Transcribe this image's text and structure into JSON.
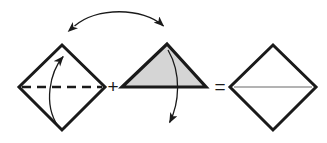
{
  "diagram": {
    "background_color": "#ffffff",
    "stroke_color": "#1a1a1a",
    "triangle_fill_color": "#d5d5d5",
    "result_line_color": "#9a9a9a",
    "operators": {
      "plus": "+",
      "equals": "="
    },
    "shapes": [
      {
        "id": "left-diamond",
        "name": "diamond-with-fold-line",
        "kind": "square-rotated-45",
        "fill": "none",
        "stroke": "#1a1a1a",
        "stroke_width": 3,
        "vertices": [
          {
            "x": 62,
            "y": 45
          },
          {
            "x": 105,
            "y": 87
          },
          {
            "x": 62,
            "y": 130
          },
          {
            "x": 19,
            "y": 87
          }
        ],
        "fold_line": {
          "name": "dashed-fold-line",
          "style": "dashed",
          "from": {
            "x": 22,
            "y": 87
          },
          "to": {
            "x": 102,
            "y": 87
          },
          "stroke_width": 2.4,
          "dash": "9 6"
        }
      },
      {
        "id": "middle-triangle",
        "name": "shaded-triangle",
        "kind": "triangle",
        "fill": "#d5d5d5",
        "stroke": "#1a1a1a",
        "stroke_width": 3.2,
        "vertices": [
          {
            "x": 167,
            "y": 44
          },
          {
            "x": 206,
            "y": 87
          },
          {
            "x": 122,
            "y": 87
          }
        ]
      },
      {
        "id": "right-diamond",
        "name": "result-diamond",
        "kind": "square-rotated-45",
        "fill": "none",
        "stroke": "#1a1a1a",
        "stroke_width": 3,
        "vertices": [
          {
            "x": 273,
            "y": 45
          },
          {
            "x": 316,
            "y": 87
          },
          {
            "x": 273,
            "y": 130
          },
          {
            "x": 230,
            "y": 87
          }
        ],
        "seam_line": {
          "name": "gray-seam-line",
          "style": "solid",
          "from": {
            "x": 234,
            "y": 87
          },
          "to": {
            "x": 312,
            "y": 87
          },
          "stroke_width": 1.6,
          "color": "#9a9a9a"
        }
      }
    ],
    "arrows": [
      {
        "id": "fold-up-arrow",
        "name": "fold-up-arrow",
        "direction": "up",
        "path": "M 58 126 C 43 104, 50 72, 64 55",
        "head_at": {
          "x": 64,
          "y": 55
        },
        "head_angle": -50,
        "stroke_width": 1.3
      },
      {
        "id": "transfer-arrow",
        "name": "double-headed-transfer-arrow",
        "direction": "bidirectional",
        "path": "M 72 28 C 95 7, 145 7, 166 28",
        "head_start": {
          "x": 72,
          "y": 28
        },
        "head_end": {
          "x": 166,
          "y": 28
        },
        "stroke_width": 1.3
      },
      {
        "id": "unfold-down-arrow",
        "name": "unfold-down-arrow",
        "direction": "down",
        "path": "M 168 50 C 182 74, 179 104, 170 124",
        "head_at": {
          "x": 170,
          "y": 124
        },
        "head_angle": 112,
        "stroke_width": 1.3
      }
    ],
    "operator_positions": {
      "plus": {
        "x": 113,
        "y": 87
      },
      "equals": {
        "x": 220,
        "y": 87
      }
    }
  }
}
